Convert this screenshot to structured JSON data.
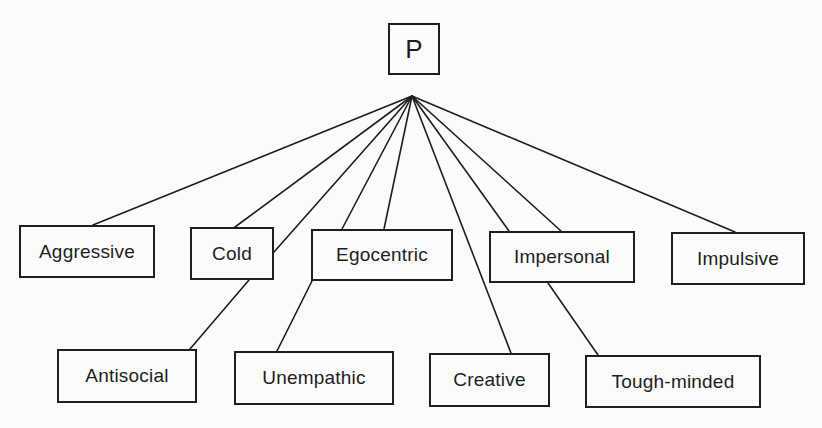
{
  "diagram": {
    "root": {
      "id": "P",
      "label": "P",
      "box": [
        388,
        23,
        52,
        52
      ]
    },
    "apex": [
      412,
      96
    ],
    "nodes": [
      {
        "id": "aggressive",
        "label": "Aggressive",
        "box": [
          19,
          225,
          136,
          53
        ]
      },
      {
        "id": "cold",
        "label": "Cold",
        "box": [
          190,
          227,
          84,
          53
        ]
      },
      {
        "id": "egocentric",
        "label": "Egocentric",
        "box": [
          311,
          229,
          142,
          52
        ]
      },
      {
        "id": "impersonal",
        "label": "Impersonal",
        "box": [
          489,
          231,
          146,
          52
        ]
      },
      {
        "id": "impulsive",
        "label": "Impulsive",
        "box": [
          671,
          232,
          134,
          53
        ]
      },
      {
        "id": "antisocial",
        "label": "Antisocial",
        "box": [
          57,
          349,
          140,
          54
        ]
      },
      {
        "id": "unempathic",
        "label": "Unempathic",
        "box": [
          234,
          351,
          160,
          54
        ]
      },
      {
        "id": "creative",
        "label": "Creative",
        "box": [
          429,
          353,
          121,
          54
        ]
      },
      {
        "id": "tough-minded",
        "label": "Tough-minded",
        "box": [
          585,
          355,
          176,
          53
        ]
      }
    ],
    "edges": [
      {
        "from": "P",
        "to": "aggressive",
        "points": [
          412,
          96,
          93,
          225
        ]
      },
      {
        "from": "P",
        "to": "cold",
        "points": [
          412,
          96,
          235,
          227
        ]
      },
      {
        "from": "P",
        "to": "antisocial",
        "via": "cold",
        "points": [
          412,
          96,
          274,
          252
        ]
      },
      {
        "from": "P",
        "to": "egocentric",
        "points": [
          412,
          96,
          342,
          229
        ]
      },
      {
        "from": "P",
        "to": "egocentric",
        "points": [
          412,
          96,
          384,
          229
        ]
      },
      {
        "from": "P",
        "to": "creative",
        "points": [
          412,
          96,
          511,
          353
        ]
      },
      {
        "from": "P",
        "to": "impersonal",
        "points": [
          412,
          96,
          509,
          231
        ]
      },
      {
        "from": "P",
        "to": "impersonal",
        "points": [
          412,
          96,
          561,
          231
        ]
      },
      {
        "from": "P",
        "to": "impulsive",
        "points": [
          412,
          96,
          735,
          232
        ]
      },
      {
        "from": "cold",
        "to": "antisocial",
        "points": [
          249,
          280,
          190,
          349
        ]
      },
      {
        "from": "egocentric",
        "to": "unempathic",
        "points": [
          312,
          281,
          277,
          351
        ]
      },
      {
        "from": "impersonal",
        "to": "tough-minded",
        "points": [
          548,
          283,
          598,
          355
        ]
      }
    ]
  },
  "colors": {
    "background": "#fbfbfb",
    "stroke": "#1e1e1e",
    "text": "#1e1e1e"
  }
}
